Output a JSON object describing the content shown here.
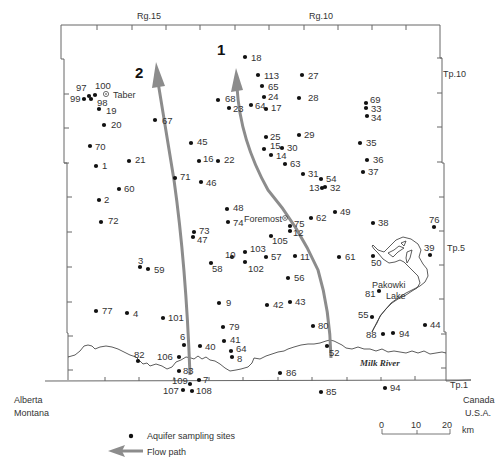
{
  "map": {
    "range_labels": [
      "Rg.15",
      "Rg.10"
    ],
    "township_labels": [
      "Tp.10",
      "Tp.5",
      "Tp.1"
    ],
    "flow_path_labels": [
      "1",
      "2"
    ],
    "places": [
      {
        "name": "Taber",
        "x": 106,
        "y": 95
      },
      {
        "name": "Foremost",
        "x": 284,
        "y": 219
      },
      {
        "name": "Pakowki",
        "x": 386,
        "y": 285
      },
      {
        "name": "Lake",
        "x": 386,
        "y": 296
      }
    ],
    "river": {
      "name": "Milk River"
    },
    "boundaries": {
      "west_upper": "Alberta",
      "west_lower": "Montana",
      "east_upper": "Canada",
      "east_lower": "U.S.A."
    },
    "sites": [
      {
        "id": "97",
        "x": 89,
        "y": 96,
        "lx": 76,
        "ly": 91
      },
      {
        "id": "100",
        "x": 95,
        "y": 95,
        "lx": 95,
        "ly": 89
      },
      {
        "id": "99",
        "x": 84,
        "y": 99,
        "lx": 70,
        "ly": 102
      },
      {
        "id": "98",
        "x": 91,
        "y": 99,
        "lx": 97,
        "ly": 106
      },
      {
        "id": "19",
        "x": 99,
        "y": 109,
        "lx": 106,
        "ly": 114
      },
      {
        "id": "20",
        "x": 104,
        "y": 125,
        "lx": 111,
        "ly": 128
      },
      {
        "id": "67",
        "x": 155,
        "y": 120,
        "lx": 162,
        "ly": 124
      },
      {
        "id": "68",
        "x": 218,
        "y": 100,
        "lx": 225,
        "ly": 102
      },
      {
        "id": "23",
        "x": 229,
        "y": 108,
        "lx": 233,
        "ly": 112
      },
      {
        "id": "18",
        "x": 245,
        "y": 57,
        "lx": 251,
        "ly": 61
      },
      {
        "id": "113",
        "x": 258,
        "y": 75,
        "lx": 264,
        "ly": 79
      },
      {
        "id": "65",
        "x": 262,
        "y": 86,
        "lx": 268,
        "ly": 90
      },
      {
        "id": "24",
        "x": 264,
        "y": 97,
        "lx": 268,
        "ly": 100
      },
      {
        "id": "64",
        "x": 251,
        "y": 105,
        "lx": 255,
        "ly": 109
      },
      {
        "id": "17",
        "x": 266,
        "y": 109,
        "lx": 271,
        "ly": 111
      },
      {
        "id": "27",
        "x": 302,
        "y": 75,
        "lx": 308,
        "ly": 79
      },
      {
        "id": "28",
        "x": 299,
        "y": 98,
        "lx": 308,
        "ly": 101
      },
      {
        "id": "69",
        "x": 366,
        "y": 103,
        "lx": 370,
        "ly": 103
      },
      {
        "id": "33",
        "x": 366,
        "y": 108,
        "lx": 371,
        "ly": 112
      },
      {
        "id": "34",
        "x": 367,
        "y": 116,
        "lx": 371,
        "ly": 121
      },
      {
        "id": "45",
        "x": 191,
        "y": 143,
        "lx": 197,
        "ly": 145
      },
      {
        "id": "70",
        "x": 90,
        "y": 146,
        "lx": 95,
        "ly": 150
      },
      {
        "id": "25",
        "x": 266,
        "y": 137,
        "lx": 270,
        "ly": 140
      },
      {
        "id": "29",
        "x": 299,
        "y": 135,
        "lx": 304,
        "ly": 138
      },
      {
        "id": "15",
        "x": 264,
        "y": 149,
        "lx": 270,
        "ly": 149
      },
      {
        "id": "30",
        "x": 282,
        "y": 148,
        "lx": 287,
        "ly": 151
      },
      {
        "id": "14",
        "x": 271,
        "y": 155,
        "lx": 276,
        "ly": 159
      },
      {
        "id": "35",
        "x": 360,
        "y": 143,
        "lx": 366,
        "ly": 146
      },
      {
        "id": "1",
        "x": 96,
        "y": 166,
        "lx": 102,
        "ly": 169
      },
      {
        "id": "21",
        "x": 129,
        "y": 161,
        "lx": 135,
        "ly": 163
      },
      {
        "id": "16",
        "x": 199,
        "y": 161,
        "lx": 203,
        "ly": 162
      },
      {
        "id": "22",
        "x": 218,
        "y": 161,
        "lx": 224,
        "ly": 163
      },
      {
        "id": "63",
        "x": 285,
        "y": 164,
        "lx": 290,
        "ly": 167
      },
      {
        "id": "36",
        "x": 367,
        "y": 160,
        "lx": 373,
        "ly": 163
      },
      {
        "id": "71",
        "x": 175,
        "y": 178,
        "lx": 180,
        "ly": 180
      },
      {
        "id": "46",
        "x": 201,
        "y": 182,
        "lx": 206,
        "ly": 186
      },
      {
        "id": "31",
        "x": 303,
        "y": 174,
        "lx": 308,
        "ly": 177
      },
      {
        "id": "54",
        "x": 321,
        "y": 179,
        "lx": 326,
        "ly": 182
      },
      {
        "id": "13",
        "x": 322,
        "y": 188,
        "lx": 309,
        "ly": 191
      },
      {
        "id": "32",
        "x": 325,
        "y": 187,
        "lx": 330,
        "ly": 191
      },
      {
        "id": "37",
        "x": 363,
        "y": 172,
        "lx": 368,
        "ly": 175
      },
      {
        "id": "60",
        "x": 119,
        "y": 189,
        "lx": 124,
        "ly": 192
      },
      {
        "id": "2",
        "x": 99,
        "y": 200,
        "lx": 104,
        "ly": 203
      },
      {
        "id": "48",
        "x": 227,
        "y": 209,
        "lx": 233,
        "ly": 211
      },
      {
        "id": "74",
        "x": 228,
        "y": 222,
        "lx": 233,
        "ly": 226
      },
      {
        "id": "49",
        "x": 335,
        "y": 212,
        "lx": 340,
        "ly": 215
      },
      {
        "id": "62",
        "x": 311,
        "y": 218,
        "lx": 316,
        "ly": 221
      },
      {
        "id": "75",
        "x": 290,
        "y": 226,
        "lx": 294,
        "ly": 227
      },
      {
        "id": "12",
        "x": 290,
        "y": 231,
        "lx": 293,
        "ly": 236
      },
      {
        "id": "38",
        "x": 373,
        "y": 223,
        "lx": 378,
        "ly": 226
      },
      {
        "id": "76",
        "x": 434,
        "y": 227,
        "lx": 429,
        "ly": 223
      },
      {
        "id": "72",
        "x": 101,
        "y": 222,
        "lx": 108,
        "ly": 224
      },
      {
        "id": "73",
        "x": 194,
        "y": 232,
        "lx": 199,
        "ly": 234
      },
      {
        "id": "47",
        "x": 193,
        "y": 237,
        "lx": 197,
        "ly": 243
      },
      {
        "id": "105",
        "x": 271,
        "y": 236,
        "lx": 272,
        "ly": 244
      },
      {
        "id": "103",
        "x": 245,
        "y": 252,
        "lx": 250,
        "ly": 252
      },
      {
        "id": "10",
        "x": 232,
        "y": 257,
        "lx": 225,
        "ly": 258
      },
      {
        "id": "57",
        "x": 266,
        "y": 257,
        "lx": 271,
        "ly": 260
      },
      {
        "id": "11",
        "x": 295,
        "y": 256,
        "lx": 300,
        "ly": 260
      },
      {
        "id": "61",
        "x": 339,
        "y": 257,
        "lx": 345,
        "ly": 260
      },
      {
        "id": "50",
        "x": 373,
        "y": 256,
        "lx": 371,
        "ly": 266
      },
      {
        "id": "39",
        "x": 430,
        "y": 255,
        "lx": 424,
        "ly": 251
      },
      {
        "id": "58",
        "x": 211,
        "y": 263,
        "lx": 212,
        "ly": 272
      },
      {
        "id": "102",
        "x": 245,
        "y": 262,
        "lx": 248,
        "ly": 272
      },
      {
        "id": "3",
        "x": 140,
        "y": 267,
        "lx": 138,
        "ly": 264
      },
      {
        "id": "59",
        "x": 148,
        "y": 269,
        "lx": 154,
        "ly": 273
      },
      {
        "id": "56",
        "x": 288,
        "y": 278,
        "lx": 294,
        "ly": 281
      },
      {
        "id": "81",
        "x": 379,
        "y": 291,
        "lx": 365,
        "ly": 297
      },
      {
        "id": "77",
        "x": 96,
        "y": 311,
        "lx": 102,
        "ly": 314
      },
      {
        "id": "4",
        "x": 127,
        "y": 313,
        "lx": 133,
        "ly": 317
      },
      {
        "id": "101",
        "x": 163,
        "y": 318,
        "lx": 168,
        "ly": 321
      },
      {
        "id": "9",
        "x": 219,
        "y": 303,
        "lx": 226,
        "ly": 306
      },
      {
        "id": "42",
        "x": 267,
        "y": 305,
        "lx": 273,
        "ly": 308
      },
      {
        "id": "43",
        "x": 290,
        "y": 302,
        "lx": 295,
        "ly": 305
      },
      {
        "id": "55",
        "x": 372,
        "y": 317,
        "lx": 358,
        "ly": 318
      },
      {
        "id": "44",
        "x": 425,
        "y": 325,
        "lx": 430,
        "ly": 328
      },
      {
        "id": "79",
        "x": 223,
        "y": 327,
        "lx": 229,
        "ly": 330
      },
      {
        "id": "80",
        "x": 313,
        "y": 326,
        "lx": 318,
        "ly": 329
      },
      {
        "id": "88",
        "x": 383,
        "y": 334,
        "lx": 366,
        "ly": 338
      },
      {
        "id": "94",
        "x": 393,
        "y": 333,
        "lx": 399,
        "ly": 337
      },
      {
        "id": "6",
        "x": 184,
        "y": 345,
        "lx": 180,
        "ly": 340
      },
      {
        "id": "40",
        "x": 200,
        "y": 346,
        "lx": 205,
        "ly": 350
      },
      {
        "id": "41",
        "x": 224,
        "y": 341,
        "lx": 230,
        "ly": 343
      },
      {
        "id": "64",
        "x": 231,
        "y": 351,
        "lx": 236,
        "ly": 352
      },
      {
        "id": "8",
        "x": 232,
        "y": 357,
        "lx": 237,
        "ly": 362
      },
      {
        "id": "106",
        "x": 179,
        "y": 357,
        "lx": 157,
        "ly": 360
      },
      {
        "id": "82",
        "x": 138,
        "y": 361,
        "lx": 134,
        "ly": 358
      },
      {
        "id": "52",
        "x": 327,
        "y": 346,
        "lx": 329,
        "ly": 356
      },
      {
        "id": "83",
        "x": 179,
        "y": 371,
        "lx": 183,
        "ly": 374
      },
      {
        "id": "86",
        "x": 280,
        "y": 373,
        "lx": 286,
        "ly": 376
      },
      {
        "id": "7",
        "x": 199,
        "y": 380,
        "lx": 203,
        "ly": 383
      },
      {
        "id": "109",
        "x": 190,
        "y": 384,
        "lx": 172,
        "ly": 384
      },
      {
        "id": "107",
        "x": 183,
        "y": 390,
        "lx": 163,
        "ly": 394
      },
      {
        "id": "108",
        "x": 192,
        "y": 391,
        "lx": 196,
        "ly": 394
      },
      {
        "id": "85",
        "x": 321,
        "y": 392,
        "lx": 326,
        "ly": 395
      },
      {
        "id": "94",
        "x": 385,
        "y": 388,
        "lx": 390,
        "ly": 391
      }
    ]
  },
  "scale_bar": {
    "ticks": [
      "0",
      "10",
      "20"
    ],
    "unit": "km"
  },
  "legend": {
    "items": [
      {
        "symbol": "dot",
        "label": "Aquifer sampling sites"
      },
      {
        "symbol": "arrow",
        "label": "Flow path"
      }
    ]
  },
  "colors": {
    "flow_path": "#8c8c8c",
    "site_dot": "#111111",
    "line": "#555555"
  }
}
